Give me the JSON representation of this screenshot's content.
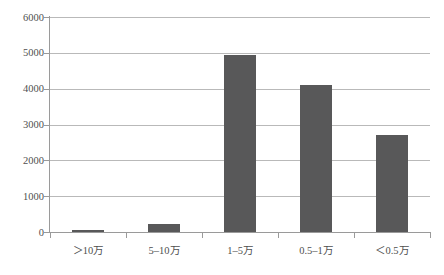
{
  "chart_data": {
    "type": "bar",
    "title": "",
    "subtitle": "",
    "xlabel": "",
    "ylabel": "",
    "categories": [
      "＞10万",
      "5–10万",
      "1–5万",
      "0.5–1万",
      "＜0.5万"
    ],
    "values": [
      55,
      210,
      4950,
      4110,
      2700
    ],
    "series": [
      {
        "name": "",
        "values": [
          55,
          210,
          4950,
          4110,
          2700
        ]
      }
    ],
    "ylim": [
      0,
      6000
    ],
    "yticks": [
      0,
      1000,
      2000,
      3000,
      4000,
      5000,
      6000
    ],
    "ytick_labels": [
      "0",
      "1000",
      "2000",
      "3000",
      "4000",
      "5000",
      "6000"
    ],
    "grid": true,
    "legend": false,
    "legend_position": "none",
    "bar_color": "#585859",
    "gridline_color": "#b9b9b9",
    "axis_color": "#9a9a9a",
    "annotations": []
  }
}
